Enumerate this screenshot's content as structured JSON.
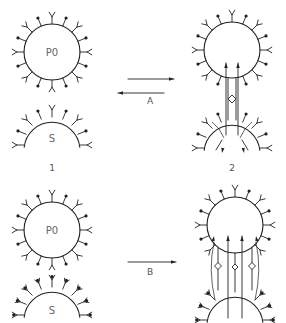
{
  "figure": {
    "panels": [
      {
        "id": "1",
        "label": "1",
        "top_cell": "P0",
        "bottom_cell": "S",
        "state": "unbound"
      },
      {
        "id": "2",
        "label": "2",
        "top_cell": "",
        "bottom_cell": "",
        "state": "bound-single-bridge"
      },
      {
        "id": "3",
        "label": "",
        "top_cell": "P0",
        "bottom_cell": "S",
        "state": "unbound"
      },
      {
        "id": "4",
        "label": "",
        "top_cell": "",
        "bottom_cell": "",
        "state": "bound-multiple-bridges"
      }
    ],
    "transitions": [
      {
        "label": "A",
        "direction": "reversible",
        "from": "1",
        "to": "2"
      },
      {
        "label": "B",
        "direction": "forward",
        "from": "3",
        "to": "4"
      }
    ],
    "labels": {
      "top_left_cell": "P0",
      "top_left_bottom_cell": "S",
      "bottom_left_cell": "P0",
      "bottom_left_bottom_cell": "S",
      "panel_1": "1",
      "panel_2": "2",
      "arrow_a": "A",
      "arrow_b": "B"
    },
    "colors": {
      "line": "#222222",
      "text": "#555555",
      "background": "#ffffff"
    }
  }
}
